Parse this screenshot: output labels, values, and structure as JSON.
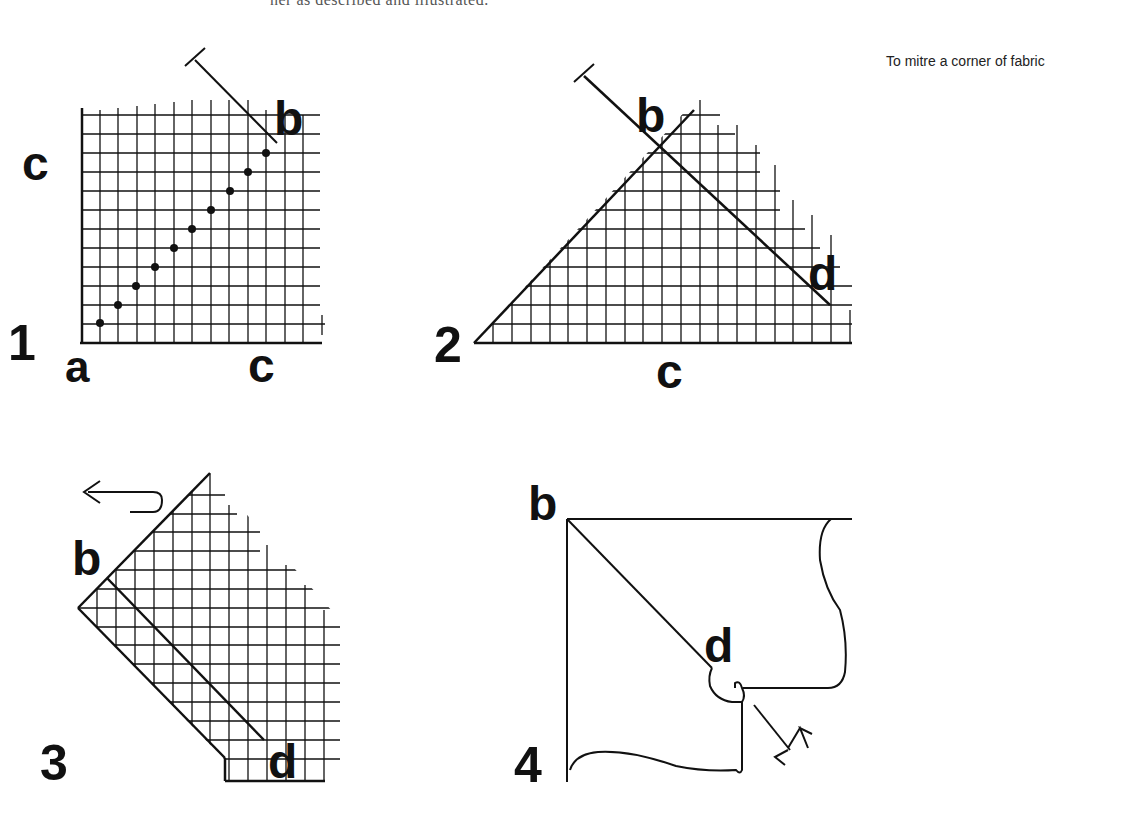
{
  "header": {
    "cut_text": "ner as described and illustrated."
  },
  "caption": "To mitre a corner of fabric",
  "panels": [
    {
      "number": "1",
      "labels": {
        "a": "a",
        "b": "b",
        "c_left": "c",
        "c_bottom": "c"
      }
    },
    {
      "number": "2",
      "labels": {
        "b": "b",
        "d": "d",
        "c": "c"
      }
    },
    {
      "number": "3",
      "labels": {
        "b": "b",
        "d": "d"
      }
    },
    {
      "number": "4",
      "labels": {
        "b": "b",
        "d": "d"
      }
    }
  ]
}
